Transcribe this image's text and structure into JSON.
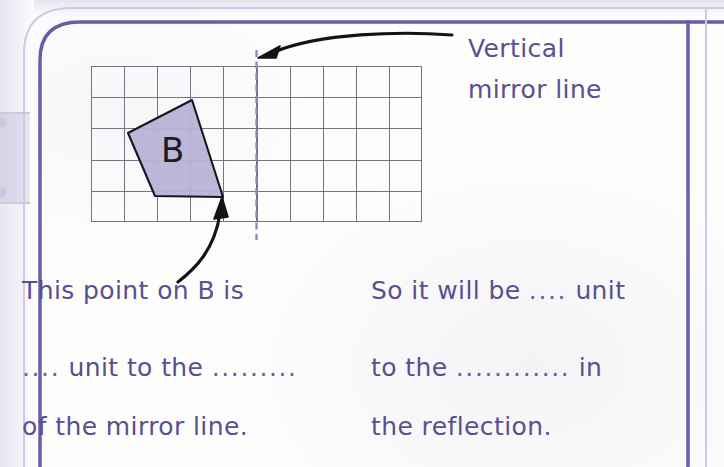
{
  "worksheet": {
    "page_background_color": "#fdfdfc",
    "accent_color": "#5b4f90",
    "frame_color": "#6a5aa8",
    "shape_fill_color": "#b9b3d8",
    "shape_stroke_color": "#1d1b22",
    "mirror_line_color": "#8d86c4",
    "grid_line_color": "#6f6f7a"
  },
  "annotations": {
    "mirror_label_line1": "Vertical",
    "mirror_label_line2": "mirror line",
    "mirror_label_full": "Vertical mirror line",
    "arrow_to_mirror": "curved-arrow-pointing-to-mirror-line",
    "arrow_to_point": "curved-arrow-pointing-to-shape-vertex"
  },
  "diagram": {
    "shape_label": "B",
    "grid": {
      "columns": 10,
      "rows": 5,
      "cell_size_px": 33,
      "origin_x_px": 91,
      "origin_y_px": 66
    },
    "mirror_line": {
      "orientation": "vertical",
      "grid_column_index": 5,
      "style": "dashed",
      "x_px": 256
    },
    "shape_vertices_px": [
      [
        192,
        100
      ],
      [
        128,
        133
      ],
      [
        155,
        196
      ],
      [
        223,
        197
      ]
    ],
    "marked_point_px": [
      223,
      197
    ]
  },
  "questions": {
    "left": {
      "line1": "This point on B is",
      "line2_pre": "....",
      "line2_mid": " unit to the ",
      "line2_blank": ".........",
      "line3": "of the mirror line."
    },
    "right": {
      "line1_pre": "So it will be ",
      "line1_blank": "....",
      "line1_post": " unit",
      "line2_pre": "to the ",
      "line2_blank": "............",
      "line2_post": " in",
      "line3": "the reflection."
    }
  }
}
